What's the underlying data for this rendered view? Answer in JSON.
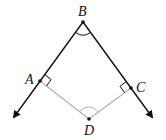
{
  "diagram": {
    "type": "geometry",
    "colors": {
      "ray": "#111111",
      "perpendicular": "#b3b3b3",
      "label": "#111111"
    },
    "points": {
      "B": {
        "label": "B",
        "x": 83,
        "y": 22
      },
      "A": {
        "label": "A",
        "x": 40,
        "y": 81
      },
      "C": {
        "label": "C",
        "x": 131,
        "y": 88
      },
      "D": {
        "label": "D",
        "x": 89,
        "y": 119
      }
    },
    "rays": [
      {
        "from": "B",
        "through": "A",
        "tip": [
          11,
          121
        ]
      },
      {
        "from": "B",
        "through": "C",
        "tip": [
          155,
          121
        ]
      }
    ],
    "segments": [
      {
        "from": "A",
        "to": "D"
      },
      {
        "from": "C",
        "to": "D"
      }
    ],
    "marks": {
      "angle_arcs": [
        "B",
        "D"
      ],
      "right_angles": [
        "A",
        "C"
      ]
    }
  }
}
